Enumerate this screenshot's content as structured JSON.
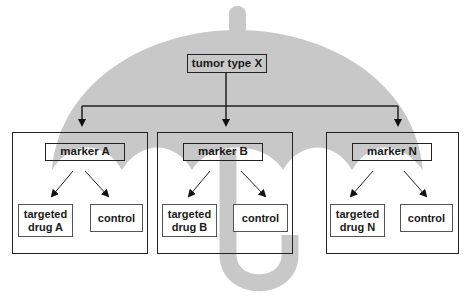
{
  "diagram": {
    "colors": {
      "umbrella": "#c8c8c8",
      "lines": "#222222",
      "background": "#ffffff"
    },
    "root": {
      "label": "tumor type X"
    },
    "arms": [
      {
        "marker": "marker A",
        "treatment": "targeted drug A",
        "treatment_lines": [
          "targeted",
          "drug A"
        ],
        "control": "control"
      },
      {
        "marker": "marker B",
        "treatment": "targeted drug B",
        "treatment_lines": [
          "targeted",
          "drug B"
        ],
        "control": "control"
      },
      {
        "marker": "marker N",
        "treatment": "targeted drug N",
        "treatment_lines": [
          "targeted",
          "drug N"
        ],
        "control": "control"
      }
    ]
  }
}
